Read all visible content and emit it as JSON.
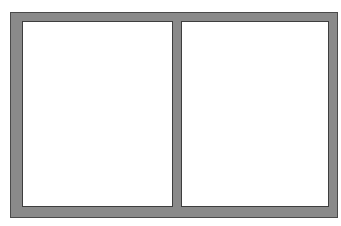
{
  "diagram": {
    "type": "window-frame",
    "panes": [
      {
        "id": "left",
        "label": ""
      },
      {
        "id": "right",
        "label": ""
      }
    ],
    "colors": {
      "frame": "#8a8a8a",
      "frame_edge": "#4a4a4a",
      "pane_fill": "#ffffff",
      "pane_edge": "#3e3e3e"
    }
  }
}
